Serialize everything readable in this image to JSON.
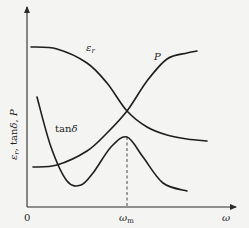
{
  "chart_data": {
    "type": "line",
    "title": "",
    "xlabel": "ω",
    "ylabel": "εr, tanδ, P",
    "x_ticks": [
      {
        "label": "0",
        "at": 0
      },
      {
        "label": "ωm",
        "at": 0.5
      }
    ],
    "xlim": [
      0,
      1
    ],
    "ylim": [
      0,
      1
    ],
    "grid": false,
    "legend": "none (curves labelled inline)",
    "annotations": [
      {
        "text": "ωm",
        "type": "dashed vertical line at tanδ peak",
        "x": 0.5
      }
    ],
    "series": [
      {
        "name": "εr",
        "label_main": "ε",
        "label_sub": "r",
        "description": "Relative permittivity: high plateau at low ω, falls through ωm to a low plateau",
        "x": [
          0.02,
          0.15,
          0.3,
          0.4,
          0.5,
          0.6,
          0.7,
          0.8,
          0.9
        ],
        "y": [
          0.8,
          0.79,
          0.72,
          0.62,
          0.48,
          0.4,
          0.36,
          0.34,
          0.33
        ]
      },
      {
        "name": "P",
        "label_main": "P",
        "description": "Power loss: low plateau at low ω, rises through ωm to a high plateau",
        "x": [
          0.03,
          0.15,
          0.3,
          0.4,
          0.5,
          0.6,
          0.7,
          0.8,
          0.85
        ],
        "y": [
          0.2,
          0.21,
          0.28,
          0.37,
          0.48,
          0.63,
          0.74,
          0.77,
          0.78
        ]
      },
      {
        "name": "tanδ",
        "label_main": "tanδ",
        "description": "Loss tangent: falls from high value to minimum, peaks at ωm, then decays",
        "x": [
          0.05,
          0.12,
          0.2,
          0.27,
          0.33,
          0.42,
          0.5,
          0.58,
          0.68,
          0.8
        ],
        "y": [
          0.55,
          0.3,
          0.13,
          0.11,
          0.17,
          0.3,
          0.35,
          0.25,
          0.12,
          0.08
        ]
      }
    ]
  },
  "labels": {
    "origin": "0",
    "x_axis": "ω",
    "omega_m_main": "ω",
    "omega_m_sub": "m",
    "y_axis_eps": "ε",
    "y_axis_eps_sub": "r",
    "y_axis_rest": ", tanδ, P",
    "eps_main": "ε",
    "eps_sub": "r",
    "p": "P",
    "tan_delta": "tanδ"
  }
}
